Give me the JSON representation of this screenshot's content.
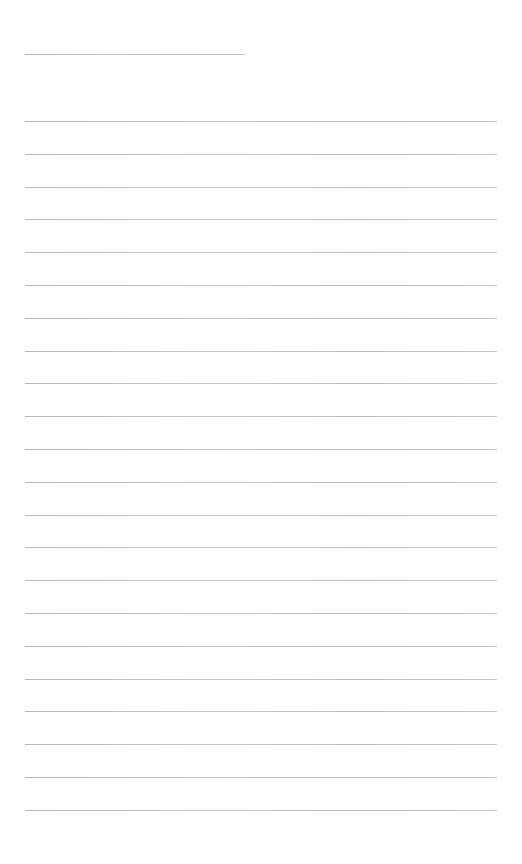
{
  "document": {
    "type": "lined-paper",
    "title_line": {
      "top": 54,
      "left": 25,
      "width": 220,
      "text": ""
    },
    "lines": {
      "count": 22,
      "first_top": 121,
      "spacing": 32.8,
      "left": 25,
      "width": 472
    },
    "line_color": "#c0c0c0",
    "background": "#ffffff"
  }
}
